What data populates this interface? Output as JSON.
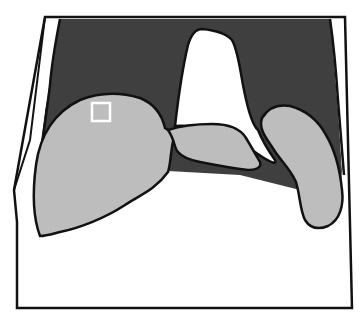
{
  "diagram": {
    "type": "schematic-outline",
    "colors": {
      "background": "#ffffff",
      "frame_stroke": "#111111",
      "dark_region": "#3f3f3f",
      "light_region": "#bdbdbd",
      "central_white": "#ffffff",
      "marker_stroke": "#ffffff"
    },
    "regions": [
      {
        "id": "outer-frame",
        "label": ""
      },
      {
        "id": "dark-upper-region",
        "label": ""
      },
      {
        "id": "central-white-peak",
        "label": ""
      },
      {
        "id": "left-gray-lobe",
        "label": ""
      },
      {
        "id": "middle-gray-bridge",
        "label": ""
      },
      {
        "id": "right-gray-lobe",
        "label": ""
      },
      {
        "id": "roi-square-marker",
        "label": ""
      }
    ]
  }
}
